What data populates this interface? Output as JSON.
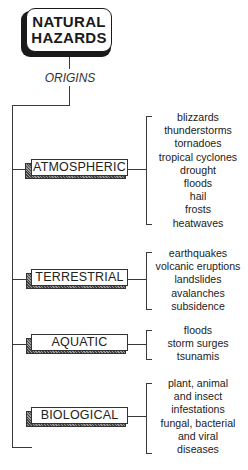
{
  "title": {
    "line1": "NATURAL",
    "line2": "HAZARDS"
  },
  "subtitle": "ORIGINS",
  "categories": [
    {
      "label": "ATMOSPHERIC",
      "items": [
        "blizzards",
        "thunderstorms",
        "tornadoes",
        "tropical cyclones",
        "drought",
        "floods",
        "hail",
        "frosts",
        "heatwaves"
      ]
    },
    {
      "label": "TERRESTRIAL",
      "items": [
        "earthquakes",
        "volcanic eruptions",
        "landslides",
        "avalanches",
        "subsidence"
      ]
    },
    {
      "label": "AQUATIC",
      "items": [
        "floods",
        "storm surges",
        "tsunamis"
      ]
    },
    {
      "label": "BIOLOGICAL",
      "items": [
        "plant, animal",
        "and insect",
        "infestations",
        "fungal, bacterial",
        "and viral",
        "diseases"
      ]
    }
  ]
}
